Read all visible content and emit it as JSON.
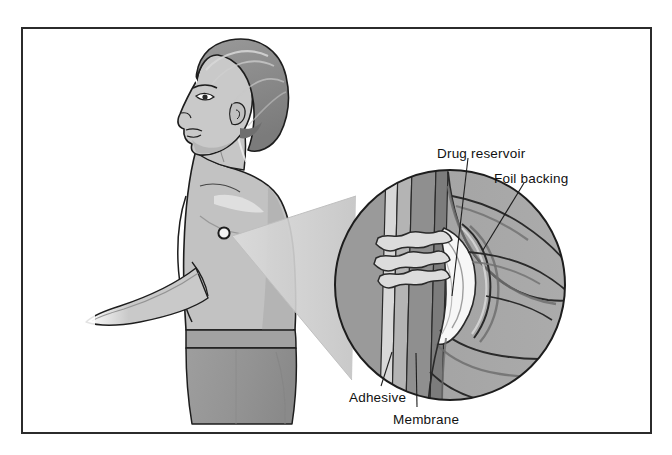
{
  "figure": {
    "kind": "medical-illustration",
    "title_visible": false,
    "frame": {
      "border_color": "#2b2b2b",
      "background": "#ffffff"
    },
    "palette": {
      "ink": "#1d1d1d",
      "skin_light": "#c9c9c9",
      "skin_mid": "#b4b4b4",
      "skin_shadow": "#9c9c9c",
      "highlight": "#f2f2f2",
      "hair_dark": "#8a8a8a",
      "hair_shadow": "#6f6f6f",
      "trousers": "#9a9a9a",
      "trousers_dark": "#8b8b8b",
      "magnifier_fill": "#a6a6a6",
      "cone_fill": "#cfcfcf",
      "layer_adhesive": "#d8d8d8",
      "layer_membrane": "#b0b0b0",
      "layer_reservoir": "#8e8e8e",
      "layer_foil": "#7d7d7d",
      "tissue_light": "#d2d2d2",
      "tissue_white": "#f6f6f6"
    }
  },
  "subject": {
    "name": "patient-profile",
    "patch_marker": {
      "name": "transdermal-patch",
      "shape": "circle",
      "cx": 224,
      "cy": 233,
      "r": 5.5
    }
  },
  "magnifier": {
    "name": "magnified-cross-section",
    "cx": 450,
    "cy": 285,
    "r": 116,
    "cone": {
      "apex_x": 232,
      "apex_y": 236
    }
  },
  "callouts": [
    {
      "id": "drug-reservoir",
      "text": "Drug reservoir",
      "x": 437,
      "y": 146,
      "leader": {
        "x1": 468,
        "y1": 158,
        "x2": 452,
        "y2": 296
      }
    },
    {
      "id": "foil-backing",
      "text": "Foil backing",
      "x": 494,
      "y": 171,
      "leader": {
        "x1": 524,
        "y1": 183,
        "x2": 483,
        "y2": 250
      }
    },
    {
      "id": "adhesive",
      "text": "Adhesive",
      "x": 349,
      "y": 390,
      "leader": {
        "x1": 381,
        "y1": 386,
        "x2": 392,
        "y2": 352
      }
    },
    {
      "id": "membrane",
      "text": "Membrane",
      "x": 393,
      "y": 412,
      "leader": {
        "x1": 417,
        "y1": 407,
        "x2": 416,
        "y2": 353
      }
    }
  ],
  "layers": [
    {
      "id": "adhesive-layer",
      "label": "Adhesive"
    },
    {
      "id": "membrane-layer",
      "label": "Membrane"
    },
    {
      "id": "drug-reservoir-layer",
      "label": "Drug reservoir"
    },
    {
      "id": "foil-backing-layer",
      "label": "Foil backing"
    }
  ]
}
